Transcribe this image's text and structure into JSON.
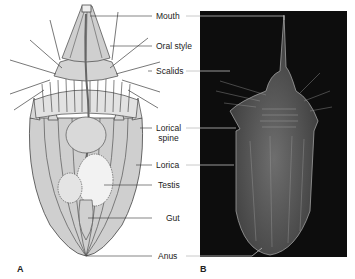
{
  "figure": {
    "panels": [
      {
        "id": "A",
        "label": "A",
        "kind": "illustration"
      },
      {
        "id": "B",
        "label": "B",
        "kind": "micrograph"
      }
    ],
    "labels": [
      {
        "text": "Mouth"
      },
      {
        "text": "Oral style"
      },
      {
        "text": "Scalids"
      },
      {
        "text": "Lorical",
        "text2": "spine"
      },
      {
        "text": "Lorica"
      },
      {
        "text": "Testis"
      },
      {
        "text": "Gut"
      },
      {
        "text": "Anus"
      }
    ],
    "colors": {
      "body_fill": "#c9c9c9",
      "outline": "#333333",
      "photo_bg": "#0d0d0d",
      "leader_dark": "#333333",
      "leader_light": "#bdbdbd"
    }
  }
}
